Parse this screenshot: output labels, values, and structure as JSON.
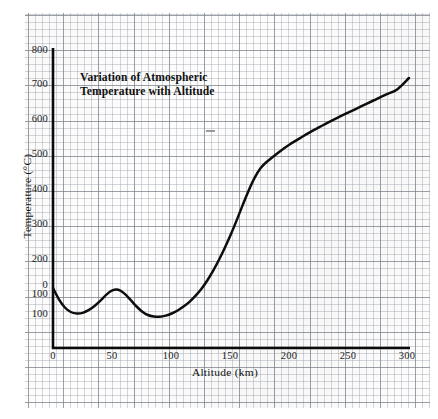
{
  "chart_data": {
    "type": "line",
    "title": "Variation of Atmospheric Temperature with Altitude",
    "title_line1": "Variation of Atmospheric",
    "title_line2": "Temperature with Altitude",
    "xlabel": "Altitude (km)",
    "ylabel": "Temperature (°C)",
    "xlim": [
      0,
      300
    ],
    "ylim": [
      -100,
      800
    ],
    "grid": true,
    "grid_style": "graph-paper",
    "legend": "none",
    "xticks": [
      0,
      50,
      100,
      150,
      200,
      250,
      300
    ],
    "xtick_labels": [
      "0",
      "50",
      "100",
      "150",
      "200",
      "250",
      "300"
    ],
    "yticks": [
      800,
      700,
      600,
      500,
      400,
      300,
      200,
      100,
      0,
      -100
    ],
    "ytick_labels": [
      "800",
      "700",
      "600",
      "500",
      "400",
      "300",
      "200",
      "100",
      "0",
      "100"
    ],
    "series": [
      {
        "name": "Atmospheric temperature",
        "color": "#0d0d0d",
        "x": [
          0,
          5,
          10,
          15,
          20,
          25,
          30,
          35,
          40,
          45,
          50,
          55,
          60,
          65,
          70,
          75,
          80,
          85,
          90,
          95,
          100,
          105,
          110,
          115,
          120,
          125,
          130,
          135,
          140,
          145,
          150,
          155,
          160,
          165,
          170,
          175,
          180,
          190,
          200,
          210,
          220,
          230,
          240,
          250,
          260,
          270,
          280,
          290,
          300
        ],
        "y": [
          0,
          -38,
          -65,
          -80,
          -85,
          -83,
          -74,
          -60,
          -42,
          -22,
          -8,
          -6,
          -18,
          -38,
          -60,
          -78,
          -90,
          -95,
          -96,
          -92,
          -85,
          -75,
          -62,
          -46,
          -26,
          -3,
          25,
          58,
          95,
          136,
          180,
          228,
          278,
          326,
          368,
          400,
          420,
          452,
          480,
          504,
          527,
          548,
          568,
          587,
          606,
          625,
          644,
          662,
          700
        ]
      }
    ],
    "annotations": [
      {
        "name": "scan-artifact-dash",
        "x": 150,
        "y": 505,
        "text": ""
      }
    ]
  },
  "axes": {
    "y_axis_name": "temperature-axis",
    "x_axis_name": "altitude-axis"
  }
}
